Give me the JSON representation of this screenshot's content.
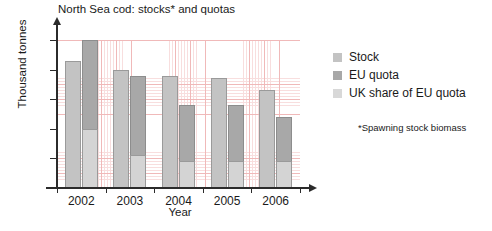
{
  "chart_data": {
    "type": "bar",
    "title": "North Sea cod: stocks* and quotas",
    "xlabel": "Year",
    "ylabel": "Thousand tonnes",
    "categories": [
      "2002",
      "2003",
      "2004",
      "2005",
      "2006"
    ],
    "ylim": [
      0,
      50
    ],
    "yticks": [
      0,
      10,
      20,
      30,
      40,
      50
    ],
    "grid": true,
    "legend_position": "right",
    "series": [
      {
        "name": "Stock",
        "values": [
          43,
          40,
          38,
          37,
          33
        ],
        "color": "#c3c3c3"
      },
      {
        "name": "EU quota",
        "values": [
          50,
          38,
          28,
          28,
          24
        ],
        "color": "#a8a8a8"
      },
      {
        "name": "UK share of EU quota",
        "values": [
          20,
          11,
          9,
          9,
          9
        ],
        "color": "#d4d4d4",
        "stacked_within": "EU quota"
      }
    ],
    "annotations": [
      "*Spawning stock biomass"
    ]
  },
  "chart": {
    "title": "North Sea cod: stocks* and quotas",
    "y_axis_label": "Thousand tonnes",
    "x_axis_label": "Year",
    "y_ticks": [
      "50",
      "40",
      "30",
      "20",
      "10",
      "0"
    ],
    "x_ticks": [
      "2002",
      "2003",
      "2004",
      "2005",
      "2006"
    ]
  },
  "legend": {
    "items": [
      {
        "label": "Stock"
      },
      {
        "label": "EU quota"
      },
      {
        "label": "UK share of EU quota"
      }
    ]
  },
  "footnote": {
    "text": "*Spawning stock biomass"
  }
}
